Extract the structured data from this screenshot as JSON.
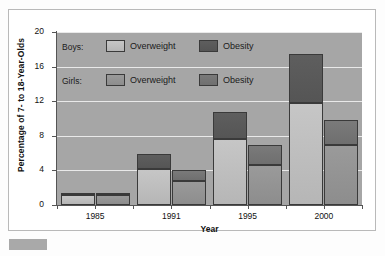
{
  "chart_data": {
    "type": "bar",
    "title": "",
    "xlabel": "Year",
    "ylabel": "Percentage of 7- to 18-Year-Olds",
    "categories": [
      "1985",
      "1991",
      "1995",
      "2000"
    ],
    "ylim": [
      0,
      20
    ],
    "yticks": [
      0,
      4,
      8,
      12,
      16,
      20
    ],
    "grid": true,
    "stacked": true,
    "legend_position": "inside-top-left",
    "series": [
      {
        "name": "Boys: Overweight",
        "group": "Boys",
        "component": "Overweight",
        "color": "#c2c2c2",
        "values": [
          1.1,
          4.2,
          7.6,
          11.8
        ]
      },
      {
        "name": "Boys: Obesity",
        "group": "Boys",
        "component": "Obesity",
        "color": "#585858",
        "values": [
          0.3,
          1.7,
          3.1,
          5.6
        ]
      },
      {
        "name": "Girls: Overweight",
        "group": "Girls",
        "component": "Overweight",
        "color": "#949494",
        "values": [
          1.1,
          2.8,
          4.6,
          6.9
        ]
      },
      {
        "name": "Girls: Obesity",
        "group": "Girls",
        "component": "Obesity",
        "color": "#757575",
        "values": [
          0.3,
          1.3,
          2.3,
          2.9
        ]
      }
    ],
    "totals": {
      "boys": [
        1.4,
        5.9,
        10.7,
        17.4
      ],
      "girls": [
        1.4,
        4.1,
        6.9,
        9.8
      ]
    },
    "annotations": []
  },
  "legend": {
    "rows": [
      {
        "group_label": "Boys:",
        "items": [
          {
            "label": "Overweight"
          },
          {
            "label": "Obesity"
          }
        ]
      },
      {
        "group_label": "Girls:",
        "items": [
          {
            "label": "Overweight"
          },
          {
            "label": "Obesity"
          }
        ]
      }
    ]
  },
  "axes": {
    "y_tick_labels": [
      "20",
      "16",
      "12",
      "8",
      "4",
      "0"
    ],
    "x_tick_labels": [
      "1985",
      "1991",
      "1995",
      "2000"
    ]
  },
  "colors": {
    "plot_background": "#a6a6a6",
    "gridline": "#e9e9e9",
    "frame_border": "#b9b9b9",
    "boys_overweight": "#c2c2c2",
    "boys_obesity": "#585858",
    "girls_overweight": "#949494",
    "girls_obesity": "#757575"
  }
}
